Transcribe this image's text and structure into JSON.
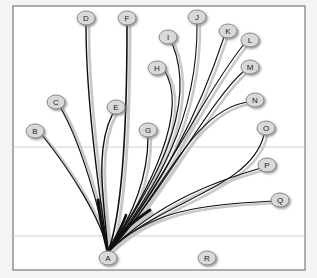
{
  "diagram": {
    "type": "tree",
    "frame": {
      "x": 13,
      "y": 6,
      "width": 292,
      "height": 264,
      "fill": "#ffffff",
      "stroke": "#7a7a7a"
    },
    "gridlines_y": [
      147,
      236
    ],
    "colors": {
      "edge": "#111111",
      "edge_shadow": "#c8c8c8",
      "node_fill": "#d9d9d9",
      "node_stroke": "#8a8a8a",
      "node_shadow": "#9a9a9a",
      "gridline": "#d0d0d0"
    },
    "nodes": [
      {
        "id": "A",
        "label": "A",
        "x": 108,
        "y": 258
      },
      {
        "id": "B",
        "label": "B",
        "x": 35,
        "y": 131
      },
      {
        "id": "C",
        "label": "C",
        "x": 56,
        "y": 102
      },
      {
        "id": "D",
        "label": "D",
        "x": 86,
        "y": 18
      },
      {
        "id": "E",
        "label": "E",
        "x": 116,
        "y": 107
      },
      {
        "id": "F",
        "label": "F",
        "x": 127,
        "y": 18
      },
      {
        "id": "G",
        "label": "G",
        "x": 148,
        "y": 130
      },
      {
        "id": "H",
        "label": "H",
        "x": 157,
        "y": 68
      },
      {
        "id": "I",
        "label": "I",
        "x": 168,
        "y": 37
      },
      {
        "id": "J",
        "label": "J",
        "x": 197,
        "y": 17
      },
      {
        "id": "K",
        "label": "K",
        "x": 228,
        "y": 31
      },
      {
        "id": "L",
        "label": "L",
        "x": 250,
        "y": 40
      },
      {
        "id": "M",
        "label": "M",
        "x": 250,
        "y": 67
      },
      {
        "id": "N",
        "label": "N",
        "x": 255,
        "y": 100
      },
      {
        "id": "O",
        "label": "O",
        "x": 266,
        "y": 128
      },
      {
        "id": "P",
        "label": "P",
        "x": 267,
        "y": 165
      },
      {
        "id": "Q",
        "label": "Q",
        "x": 280,
        "y": 200
      },
      {
        "id": "R",
        "label": "R",
        "x": 207,
        "y": 258
      }
    ],
    "edges": [
      {
        "to": "B",
        "width": 1.2,
        "d": "M108,252 C102,220 70,170 42,135"
      },
      {
        "to": "C",
        "width": 1.2,
        "d": "M108,252 C100,210 80,140 60,107"
      },
      {
        "to": "D",
        "width": 1.4,
        "d": "M108,252 C100,200 86,100 86,25"
      },
      {
        "to": "E",
        "width": 1.4,
        "d": "M108,252 C104,200 94,150 113,113"
      },
      {
        "to": "F",
        "width": 1.6,
        "d": "M108,252 C120,220 127,150 127,25"
      },
      {
        "to": "G",
        "width": 1.3,
        "d": "M108,252 C130,220 148,180 148,137"
      },
      {
        "to": "H",
        "width": 1.2,
        "d": "M108,252 C150,190 190,110 164,70"
      },
      {
        "to": "I",
        "width": 1.2,
        "d": "M108,252 C150,190 200,110 172,43"
      },
      {
        "to": "J",
        "width": 1.1,
        "d": "M108,252 C155,190 198,120 197,24"
      },
      {
        "to": "K",
        "width": 1.1,
        "d": "M108,252 C160,190 200,110 224,37"
      },
      {
        "to": "L",
        "width": 1.1,
        "d": "M108,252 C160,190 200,100 244,44"
      },
      {
        "to": "M",
        "width": 1.1,
        "d": "M108,252 C165,190 210,100 244,71"
      },
      {
        "to": "N",
        "width": 1.1,
        "d": "M108,252 C160,200 190,110 248,102"
      },
      {
        "to": "O",
        "width": 1.1,
        "d": "M108,252 C160,200 250,190 264,135"
      },
      {
        "to": "P",
        "width": 1.1,
        "d": "M108,252 C160,200 220,180 261,168"
      },
      {
        "to": "Q",
        "width": 1.1,
        "d": "M108,252 C150,210 200,205 273,201"
      }
    ]
  }
}
